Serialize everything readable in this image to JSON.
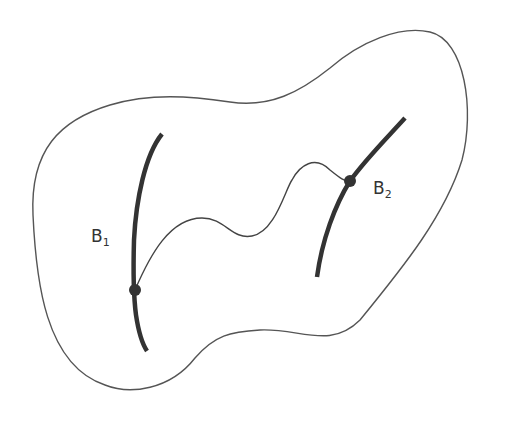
{
  "diagram": {
    "type": "topological-region-with-path",
    "colors": {
      "background": "#ffffff",
      "outline": "#555555",
      "boundary": "#333333",
      "path": "#444444",
      "point": "#333333"
    },
    "labels": {
      "b1": {
        "base": "B",
        "sub": "1"
      },
      "b2": {
        "base": "B",
        "sub": "2"
      }
    },
    "elements": [
      {
        "id": "region-outline",
        "kind": "closed-curve"
      },
      {
        "id": "boundary-b1",
        "kind": "thick-curve",
        "label": "B1"
      },
      {
        "id": "boundary-b2",
        "kind": "thick-curve",
        "label": "B2"
      },
      {
        "id": "connecting-path",
        "kind": "wavy-curve",
        "from": "B1",
        "to": "B2"
      },
      {
        "id": "point-on-b1",
        "kind": "dot"
      },
      {
        "id": "point-on-b2",
        "kind": "dot"
      }
    ]
  }
}
